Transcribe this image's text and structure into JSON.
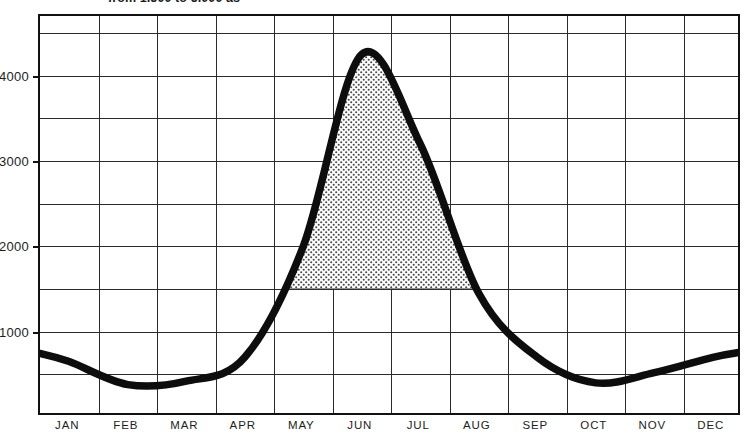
{
  "title": {
    "text": "from 1,500 to 5,000 as",
    "clipped": true
  },
  "axes": {
    "y_labels": [
      {
        "value": 4000,
        "text": "4000"
      },
      {
        "value": 3000,
        "text": "3000"
      },
      {
        "value": 2000,
        "text": "2000"
      },
      {
        "value": 1000,
        "text": "1000"
      }
    ],
    "x_labels": [
      "JAN",
      "FEB",
      "MAR",
      "APR",
      "MAY",
      "JUN",
      "JUL",
      "AUG",
      "SEP",
      "OCT",
      "NOV",
      "DEC"
    ]
  },
  "colors": {
    "curve": "#0d0d0d",
    "grid": "#2b2b2b",
    "frame": "#111111",
    "fill": "#cfcfcf",
    "background": "#ffffff",
    "text": "#1d1d1d"
  },
  "chart_data": {
    "type": "line",
    "title": "from 1,500 to 5,000 as",
    "xlabel": "",
    "ylabel": "",
    "categories": [
      "JAN",
      "FEB",
      "MAR",
      "APR",
      "MAY",
      "JUN",
      "JUL",
      "AUG",
      "SEP",
      "OCT",
      "NOV",
      "DEC"
    ],
    "series": [
      {
        "name": "Monthly demand",
        "values": [
          650,
          380,
          420,
          700,
          2000,
          4250,
          3200,
          1450,
          700,
          400,
          520,
          700
        ]
      }
    ],
    "ylim": [
      0,
      4700
    ],
    "ytick_values": [
      1000,
      2000,
      3000,
      4000
    ],
    "gridline_interval": 500,
    "grid": true,
    "legend": "none",
    "peak": {
      "month": "JUN",
      "value": 4250
    },
    "trough": {
      "month": "FEB",
      "value": 380
    },
    "shaded_region": {
      "description": "stippled area between baseline level and curve across the peak season",
      "baseline_value": 1500,
      "from_month": "MAY",
      "to_month": "AUG",
      "pattern": "dotted-stipple"
    },
    "annotations": []
  }
}
